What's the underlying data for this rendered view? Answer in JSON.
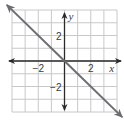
{
  "chart_data": {
    "type": "line",
    "title": "",
    "xlabel": "x",
    "ylabel": "y",
    "xlim": [
      -4,
      4
    ],
    "ylim": [
      -4,
      4
    ],
    "grid": true,
    "grid_step": 1,
    "x_tick_labels": [
      {
        "value": -2,
        "label": "−2"
      },
      {
        "value": 2,
        "label": "2"
      }
    ],
    "y_tick_labels": [
      {
        "value": 2,
        "label": "2"
      },
      {
        "value": -2,
        "label": "−2"
      }
    ],
    "series": [
      {
        "name": "y = -x",
        "equation": "y = -x",
        "x": [
          -4,
          0,
          4
        ],
        "y": [
          4,
          0,
          -4
        ],
        "arrows_both_ends": true
      }
    ],
    "legend": null
  },
  "colors": {
    "grid": "#c8c8c8",
    "axis": "#2a2a2a",
    "line": "#6b6e72",
    "text": "#3a3a3a"
  }
}
